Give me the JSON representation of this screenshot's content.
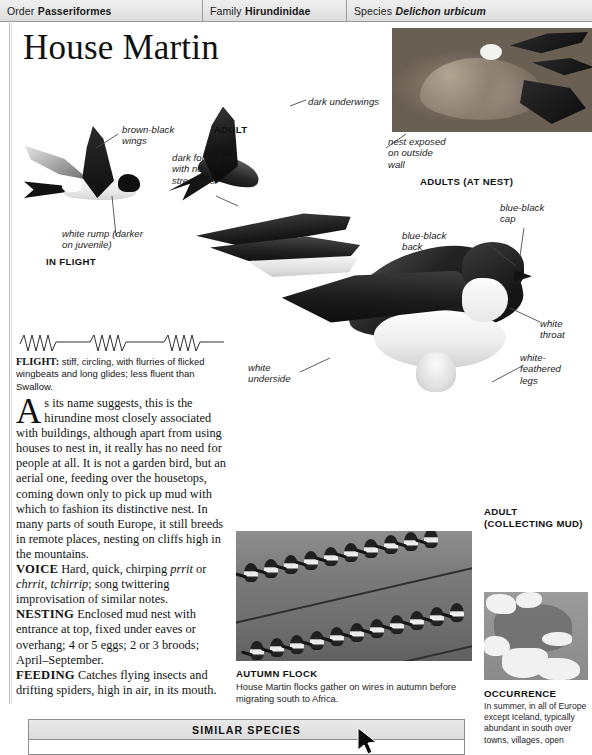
{
  "header": {
    "order_label": "Order",
    "order_value": "Passeriformes",
    "family_label": "Family",
    "family_value": "Hirundinidae",
    "species_label": "Species",
    "species_value": "Delichon urbicum"
  },
  "title": "House Martin",
  "annotations": {
    "brown_black_wings": "brown-black\nwings",
    "white_rump": "white rump (darker\non juvenile)",
    "in_flight": "IN FLIGHT",
    "adult": "ADULT",
    "dark_forked_tail": "dark forked tail\nwith no\nstreamers",
    "dark_underwings": "dark underwings",
    "nest_exposed": "nest exposed\non outside\nwall",
    "adults_at_nest": "ADULTS (AT NEST)",
    "blue_black_cap": "blue-black\ncap",
    "blue_black_back": "blue-black\nback",
    "white_throat": "white\nthroat",
    "white_feathered_legs": "white-\nfeathered\nlegs",
    "white_underside": "white\nunderside",
    "adult_collecting_mud": "ADULT\n(COLLECTING MUD)"
  },
  "flight": {
    "label": "FLIGHT:",
    "text": "stiff, circling, with flurries of flicked wingbeats and long glides; less fluent than Swallow."
  },
  "body": {
    "dropcap": "A",
    "intro": "s its name suggests, this is the hirundine most closely associated with buildings, although apart from using houses to nest in, it really has no need for people at all. It is not a garden bird, but an aerial one, feeding over the housetops, coming down only to pick up mud with which to fashion its distinctive nest. In many parts of south Europe, it still breeds in remote places, nesting on cliffs high in the mountains.",
    "voice_label": "VOICE",
    "voice_text_1": "Hard, quick, chirping ",
    "voice_call_1": "prrit",
    "voice_text_2": " or ",
    "voice_call_2": "chrrit, tchirrip",
    "voice_text_3": "; song twittering improvisation of similar notes.",
    "nesting_label": "NESTING",
    "nesting_text": "Enclosed mud nest with entrance at top, fixed under eaves or overhang; 4 or 5 eggs; 2 or 3 broods; April–September.",
    "feeding_label": "FEEDING",
    "feeding_text": "Catches flying insects and drifting spiders, high in air, in its mouth."
  },
  "flock": {
    "caption": "AUTUMN FLOCK",
    "text": "House Martin flocks gather on wires in autumn before migrating south to Africa."
  },
  "occurrence": {
    "caption": "OCCURRENCE",
    "text": "In summer, in all of Europe except Iceland, typically abundant in south over towns, villages, open"
  },
  "similar_species": {
    "heading": "SIMILAR SPECIES"
  },
  "colors": {
    "header_bg": "#e6e6e6",
    "rule": "#9a9a9a",
    "text": "#131313",
    "plumage_dark": "#141414",
    "plumage_light": "#f4f4f4"
  }
}
